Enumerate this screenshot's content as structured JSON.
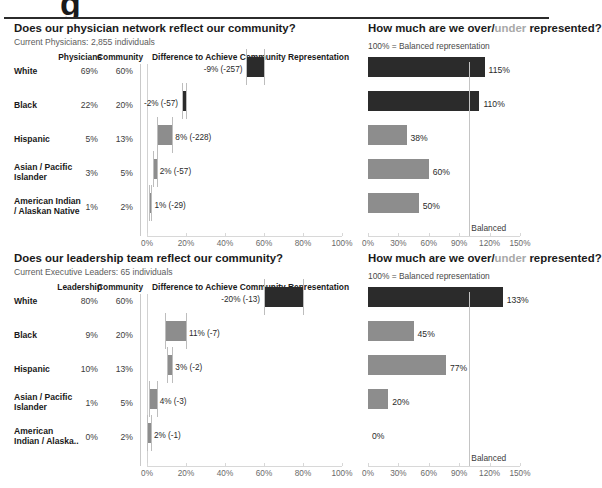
{
  "top_artifact": {
    "glyph": "g",
    "glyph_right": "•"
  },
  "charts": [
    {
      "id": "physicians",
      "title_prefix": "Does our physician network reflect our community?",
      "subtitle": "Current Physicians: 2,855 individuals",
      "col_headers": {
        "group": "Physicians",
        "community": "Community",
        "waterfall": "Difference to Achieve Community Representation"
      },
      "right_title_a": "How much are we over/",
      "right_title_muted": "under",
      "right_title_b": " represented?",
      "right_note": "100% = Balanced representation",
      "balanced_label": "Balanced",
      "rows": [
        {
          "label": "White",
          "label2": "",
          "group_pct": "69%",
          "community_pct": "60%",
          "diff_label": "-9% (-257)",
          "diff_value": -9,
          "diff_start": 60,
          "index_pct": "115%",
          "index_value": 115,
          "dark": true
        },
        {
          "label": "Black",
          "label2": "",
          "group_pct": "22%",
          "community_pct": "20%",
          "diff_label": "-2% (-57)",
          "diff_value": -2,
          "diff_start": 20,
          "index_pct": "110%",
          "index_value": 110,
          "dark": true
        },
        {
          "label": "Hispanic",
          "label2": "",
          "group_pct": "5%",
          "community_pct": "13%",
          "diff_label": "8% (-228)",
          "diff_value": 8,
          "diff_start": 5,
          "index_pct": "38%",
          "index_value": 38,
          "dark": false
        },
        {
          "label": "Asian / Pacific",
          "label2": "Islander",
          "group_pct": "3%",
          "community_pct": "5%",
          "diff_label": "2% (-57)",
          "diff_value": 2,
          "diff_start": 3,
          "index_pct": "60%",
          "index_value": 60,
          "dark": false
        },
        {
          "label": "American Indian",
          "label2": "/ Alaskan Native",
          "group_pct": "1%",
          "community_pct": "2%",
          "diff_label": "1% (-29)",
          "diff_value": 1,
          "diff_start": 1,
          "index_pct": "50%",
          "index_value": 50,
          "dark": false
        }
      ],
      "left_axis_ticks": [
        "0%",
        "20%",
        "40%",
        "60%",
        "80%",
        "100%"
      ],
      "right_axis_ticks": [
        "0%",
        "30%",
        "60%",
        "90%",
        "120%",
        "150%"
      ]
    },
    {
      "id": "leadership",
      "title_prefix": "Does our leadership team reflect our community?",
      "subtitle": "Current Executive Leaders: 65 individuals",
      "col_headers": {
        "group": "Leadership",
        "community": "Community",
        "waterfall": "Difference to Achieve Community Representation"
      },
      "right_title_a": "How much are we over/",
      "right_title_muted": "under",
      "right_title_b": " represented?",
      "right_note": "100% = Balanced representation",
      "balanced_label": "Balanced",
      "rows": [
        {
          "label": "White",
          "label2": "",
          "group_pct": "80%",
          "community_pct": "60%",
          "diff_label": "-20% (-13)",
          "diff_value": -20,
          "diff_start": 80,
          "index_pct": "133%",
          "index_value": 133,
          "dark": true
        },
        {
          "label": "Black",
          "label2": "",
          "group_pct": "9%",
          "community_pct": "20%",
          "diff_label": "11% (-7)",
          "diff_value": 11,
          "diff_start": 9,
          "index_pct": "45%",
          "index_value": 45,
          "dark": false
        },
        {
          "label": "Hispanic",
          "label2": "",
          "group_pct": "10%",
          "community_pct": "13%",
          "diff_label": "3% (-2)",
          "diff_value": 3,
          "diff_start": 10,
          "index_pct": "77%",
          "index_value": 77,
          "dark": false
        },
        {
          "label": "Asian / Pacific",
          "label2": "Islander",
          "group_pct": "1%",
          "community_pct": "5%",
          "diff_label": "4% (-3)",
          "diff_value": 4,
          "diff_start": 1,
          "index_pct": "20%",
          "index_value": 20,
          "dark": false
        },
        {
          "label": "American",
          "label2": "Indian / Alaska..",
          "group_pct": "0%",
          "community_pct": "2%",
          "diff_label": "2% (-1)",
          "diff_value": 2,
          "diff_start": 0,
          "index_pct": "0%",
          "index_value": 0,
          "dark": false
        }
      ],
      "left_axis_ticks": [
        "0%",
        "20%",
        "40%",
        "60%",
        "80%",
        "100%"
      ],
      "right_axis_ticks": [
        "0%",
        "30%",
        "60%",
        "90%",
        "120%",
        "150%"
      ]
    }
  ],
  "chart_data": [
    {
      "type": "bar",
      "title": "Does our physician network reflect our community? — Difference to Achieve Community Representation (waterfall)",
      "subtitle": "Current Physicians: 2,855 individuals",
      "categories": [
        "White",
        "Black",
        "Hispanic",
        "Asian / Pacific Islander",
        "American Indian / Alaskan Native"
      ],
      "series": [
        {
          "name": "Physicians",
          "values": [
            69,
            22,
            5,
            3,
            1
          ]
        },
        {
          "name": "Community",
          "values": [
            60,
            20,
            13,
            5,
            2
          ]
        },
        {
          "name": "Difference %",
          "values": [
            -9,
            -2,
            8,
            2,
            1
          ]
        },
        {
          "name": "Difference count",
          "values": [
            -257,
            -57,
            -228,
            -57,
            -29
          ]
        }
      ],
      "data_labels": [
        "-9% (-257)",
        "-2% (-57)",
        "8% (-228)",
        "2% (-57)",
        "1% (-29)"
      ],
      "xlabel": "",
      "ylabel": "",
      "xlim": [
        0,
        100
      ],
      "xticks": [
        "0%",
        "20%",
        "40%",
        "60%",
        "80%",
        "100%"
      ],
      "grid": false,
      "legend": "none"
    },
    {
      "type": "bar",
      "title": "How much are we over/under represented? (Physicians)",
      "subtitle": "100% = Balanced representation",
      "categories": [
        "White",
        "Black",
        "Hispanic",
        "Asian / Pacific Islander",
        "American Indian / Alaskan Native"
      ],
      "values": [
        115,
        110,
        38,
        60,
        50
      ],
      "data_labels": [
        "115%",
        "110%",
        "38%",
        "60%",
        "50%"
      ],
      "reference_line": {
        "value": 100,
        "label": "Balanced"
      },
      "xlabel": "",
      "ylabel": "",
      "xlim": [
        0,
        150
      ],
      "xticks": [
        "0%",
        "30%",
        "60%",
        "90%",
        "120%",
        "150%"
      ],
      "grid": false,
      "legend": "none"
    },
    {
      "type": "bar",
      "title": "Does our leadership team reflect our community? — Difference to Achieve Community Representation (waterfall)",
      "subtitle": "Current Executive Leaders: 65 individuals",
      "categories": [
        "White",
        "Black",
        "Hispanic",
        "Asian / Pacific Islander",
        "American Indian / Alaska.."
      ],
      "series": [
        {
          "name": "Leadership",
          "values": [
            80,
            9,
            10,
            1,
            0
          ]
        },
        {
          "name": "Community",
          "values": [
            60,
            20,
            13,
            5,
            2
          ]
        },
        {
          "name": "Difference %",
          "values": [
            -20,
            11,
            3,
            4,
            2
          ]
        },
        {
          "name": "Difference count",
          "values": [
            -13,
            -7,
            -2,
            -3,
            -1
          ]
        }
      ],
      "data_labels": [
        "-20% (-13)",
        "11% (-7)",
        "3% (-2)",
        "4% (-3)",
        "2% (-1)"
      ],
      "xlabel": "",
      "ylabel": "",
      "xlim": [
        0,
        100
      ],
      "xticks": [
        "0%",
        "20%",
        "40%",
        "60%",
        "80%",
        "100%"
      ],
      "grid": false,
      "legend": "none"
    },
    {
      "type": "bar",
      "title": "How much are we over/under represented? (Leadership)",
      "subtitle": "100% = Balanced representation",
      "categories": [
        "White",
        "Black",
        "Hispanic",
        "Asian / Pacific Islander",
        "American Indian / Alaska.."
      ],
      "values": [
        133,
        45,
        77,
        20,
        0
      ],
      "data_labels": [
        "133%",
        "45%",
        "77%",
        "20%",
        "0%"
      ],
      "reference_line": {
        "value": 100,
        "label": "Balanced"
      },
      "xlabel": "",
      "ylabel": "",
      "xlim": [
        0,
        150
      ],
      "xticks": [
        "0%",
        "30%",
        "60%",
        "90%",
        "120%",
        "150%"
      ],
      "grid": false,
      "legend": "none"
    }
  ],
  "colors": {
    "dark_bar": "#2b2b2b",
    "gray_bar": "#8d8d8d",
    "axis": "#d8d8d8",
    "rule": "#2b2b2b",
    "muted_text": "#a8a8a8"
  }
}
